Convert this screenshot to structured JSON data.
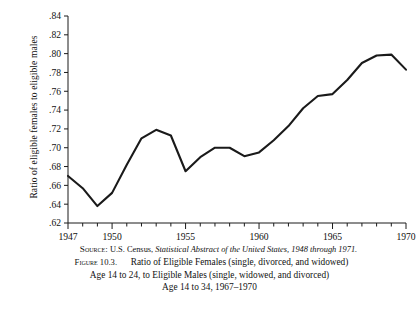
{
  "figure": {
    "y_axis_title": "Ratio of eligible females to eligible males",
    "source_prefix": "Source:",
    "source_text_1": "U.S. Census,",
    "source_italic": "Statistical Abstract of the United States, 1948 through 1971.",
    "figure_label": "Figure 10.3.",
    "caption_line_1": "Ratio of Eligible Females (single, divorced, and widowed)",
    "caption_line_2": "Age 14 to 24, to Eligible Males (single, widowed, and divorced)",
    "caption_line_3": "Age 14 to 34, 1967–1970"
  },
  "chart_data": {
    "type": "line",
    "xlabel": "",
    "ylabel": "Ratio of eligible females to eligible males",
    "xlim": [
      1947,
      1970
    ],
    "ylim": [
      0.62,
      0.84
    ],
    "grid": false,
    "legend": "none",
    "line_color": "#1a1a1a",
    "x_tick_labels": [
      "1947",
      "1950",
      "1955",
      "1960",
      "1965",
      "1970"
    ],
    "x_tick_values": [
      1947,
      1950,
      1955,
      1960,
      1965,
      1970
    ],
    "x_minor_tick_interval": 1,
    "y_tick_labels": [
      ".62",
      ".64",
      ".66",
      ".68",
      ".70",
      ".72",
      ".74",
      ".76",
      ".78",
      ".80",
      ".82",
      ".84"
    ],
    "y_tick_values": [
      0.62,
      0.64,
      0.66,
      0.68,
      0.7,
      0.72,
      0.74,
      0.76,
      0.78,
      0.8,
      0.82,
      0.84
    ],
    "x": [
      1947,
      1948,
      1949,
      1950,
      1951,
      1952,
      1953,
      1954,
      1955,
      1956,
      1957,
      1958,
      1959,
      1960,
      1961,
      1962,
      1963,
      1964,
      1965,
      1966,
      1967,
      1968,
      1969,
      1970
    ],
    "values": [
      0.67,
      0.657,
      0.638,
      0.652,
      0.682,
      0.71,
      0.719,
      0.713,
      0.675,
      0.69,
      0.7,
      0.7,
      0.691,
      0.695,
      0.708,
      0.723,
      0.742,
      0.755,
      0.757,
      0.772,
      0.79,
      0.798,
      0.799,
      0.783
    ]
  }
}
